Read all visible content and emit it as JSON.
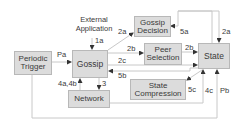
{
  "diagram": {
    "nodes": [
      {
        "id": "periodic-trigger",
        "label": "Periodic Trigger"
      },
      {
        "id": "gossip",
        "label": "Gossip"
      },
      {
        "id": "gossip-decision",
        "label": "Gossip Decision"
      },
      {
        "id": "peer-selection",
        "label": "Peer Selection"
      },
      {
        "id": "state",
        "label": "State"
      },
      {
        "id": "state-compression",
        "label": "State Compression"
      },
      {
        "id": "network",
        "label": "Network"
      }
    ],
    "external": {
      "label_line1": "External",
      "label_line2": "Application"
    },
    "edges": [
      {
        "label": "1a",
        "from": "external-application",
        "to": "gossip"
      },
      {
        "label": "Pa",
        "from": "periodic-trigger",
        "to": "gossip"
      },
      {
        "label": "2a",
        "from": "gossip",
        "to": "gossip-decision"
      },
      {
        "label": "2b",
        "from": "gossip",
        "to": "peer-selection"
      },
      {
        "label": "2c",
        "from": "gossip",
        "to": "state"
      },
      {
        "label": "5b",
        "from": "state",
        "to": "gossip"
      },
      {
        "label": "3",
        "from": "gossip",
        "to": "network"
      },
      {
        "label": "4a,4b",
        "from": "network",
        "to": "gossip"
      },
      {
        "label": "5a",
        "from": "state",
        "to": "gossip-decision"
      },
      {
        "label": "2a",
        "from": "state",
        "to": "state",
        "note": "loop into state top"
      },
      {
        "label": "2b",
        "from": "peer-selection",
        "to": "state"
      },
      {
        "label": "5c",
        "from": "state",
        "to": "state-compression"
      },
      {
        "label": "4c",
        "from": "network",
        "to": "state"
      },
      {
        "label": "Pb",
        "from": "periodic-trigger",
        "to": "state"
      }
    ],
    "colors": {
      "box_fill": "#dcdcdc",
      "box_border": "#b8b8b8",
      "line": "#c8c8c8",
      "arrow": "#333333",
      "text": "#3a3a3a"
    }
  }
}
